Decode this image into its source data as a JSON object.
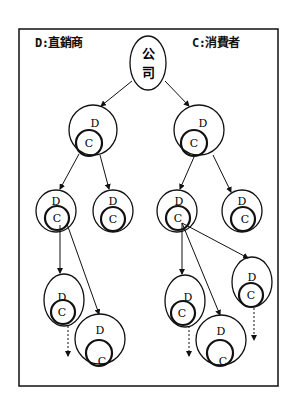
{
  "legend": {
    "distributor": "D:直銷商",
    "consumer": "C:消費者"
  },
  "root": {
    "label_line1": "公",
    "label_line2": "司"
  },
  "node_labels": {
    "outer": "D",
    "inner": "C"
  },
  "colors": {
    "stroke": "#111111",
    "background": "#ffffff"
  }
}
